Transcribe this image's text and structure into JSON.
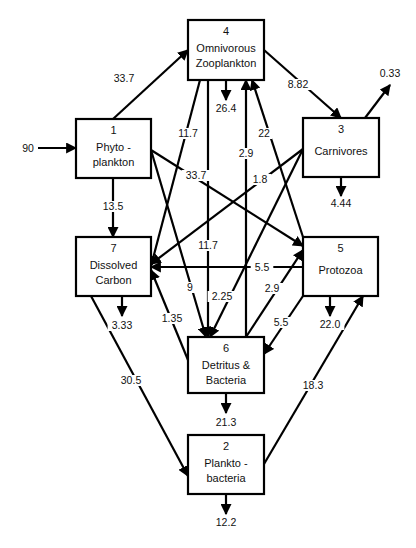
{
  "nodes": [
    {
      "id": "1",
      "number": "1",
      "line1": "Phyto  -",
      "line2": "plankton",
      "x": 76,
      "y": 119,
      "w": 75,
      "h": 59
    },
    {
      "id": "2",
      "number": "2",
      "line1": "Plankto  -",
      "line2": "bacteria",
      "x": 188,
      "y": 435,
      "w": 76,
      "h": 59
    },
    {
      "id": "3",
      "number": "3",
      "line1": "Carnivores",
      "line2": "",
      "x": 303,
      "y": 118,
      "w": 76,
      "h": 59
    },
    {
      "id": "4",
      "number": "4",
      "line1": "Omnivorous",
      "line2": "Zooplankton",
      "x": 188,
      "y": 20,
      "w": 76,
      "h": 60
    },
    {
      "id": "5",
      "number": "5",
      "line1": "Protozoa",
      "line2": "",
      "x": 303,
      "y": 237,
      "w": 75,
      "h": 59
    },
    {
      "id": "6",
      "number": "6",
      "line1": "Detritus  &",
      "line2": "Bacteria",
      "x": 188,
      "y": 337,
      "w": 76,
      "h": 56
    },
    {
      "id": "7",
      "number": "7",
      "line1": "Dissolved",
      "line2": "Carbon",
      "x": 76,
      "y": 237,
      "w": 75,
      "h": 59
    }
  ],
  "flows": [
    {
      "from": "input",
      "to": "1",
      "value": "90",
      "x1": 38,
      "y1": 148,
      "x2": 76,
      "y2": 148,
      "lx": 28,
      "ly": 152
    },
    {
      "from": "1",
      "to": "4",
      "value": "33.7",
      "x1": 113,
      "y1": 119,
      "x2": 188,
      "y2": 50,
      "lx": 124,
      "ly": 82
    },
    {
      "from": "1",
      "to": "7",
      "value": "13.5",
      "x1": 113,
      "y1": 178,
      "x2": 113,
      "y2": 237,
      "lx": 113,
      "ly": 210
    },
    {
      "from": "1",
      "to": "5",
      "value": "33.7",
      "x1": 151,
      "y1": 150,
      "x2": 303,
      "y2": 246,
      "lx": 196,
      "ly": 179
    },
    {
      "from": "1",
      "to": "6",
      "value": "9",
      "x1": 151,
      "y1": 150,
      "x2": 206,
      "y2": 337,
      "lx": 190,
      "ly": 291
    },
    {
      "from": "4",
      "to": "7",
      "value": "11.7",
      "x1": 200,
      "y1": 80,
      "x2": 151,
      "y2": 266,
      "lx": 188,
      "ly": 137
    },
    {
      "from": "4",
      "to": "6",
      "value": "11.7",
      "x1": 208,
      "y1": 80,
      "x2": 208,
      "y2": 337,
      "lx": 208,
      "ly": 249
    },
    {
      "from": "4",
      "to": "out",
      "value": "26.4",
      "x1": 226,
      "y1": 80,
      "x2": 226,
      "y2": 100,
      "lx": 226,
      "ly": 112
    },
    {
      "from": "4",
      "to": "3",
      "value": "8.82",
      "x1": 264,
      "y1": 50,
      "x2": 341,
      "y2": 118,
      "lx": 298,
      "ly": 88
    },
    {
      "from": "6",
      "to": "4",
      "value": "2.9",
      "x1": 246,
      "y1": 337,
      "x2": 246,
      "y2": 80,
      "lx": 246,
      "ly": 157
    },
    {
      "from": "5",
      "to": "4",
      "value": "22",
      "x1": 303,
      "y1": 237,
      "x2": 252,
      "y2": 80,
      "lx": 264,
      "ly": 137
    },
    {
      "from": "3",
      "to": "out",
      "value": "0.33",
      "x1": 365,
      "y1": 118,
      "x2": 390,
      "y2": 85,
      "lx": 390,
      "ly": 77
    },
    {
      "from": "3",
      "to": "7",
      "value": "1.8",
      "x1": 303,
      "y1": 149,
      "x2": 151,
      "y2": 264,
      "lx": 260,
      "ly": 183
    },
    {
      "from": "3",
      "to": "6",
      "value": "2.25",
      "x1": 303,
      "y1": 149,
      "x2": 210,
      "y2": 337,
      "lx": 222,
      "ly": 300
    },
    {
      "from": "3",
      "to": "out",
      "value": "4.44",
      "x1": 341,
      "y1": 177,
      "x2": 341,
      "y2": 196,
      "lx": 341,
      "ly": 207
    },
    {
      "from": "5",
      "to": "7",
      "value": "5.5",
      "x1": 303,
      "y1": 267,
      "x2": 151,
      "y2": 267,
      "lx": 262,
      "ly": 271
    },
    {
      "from": "6",
      "to": "5",
      "value": "2.9",
      "x1": 246,
      "y1": 337,
      "x2": 303,
      "y2": 250,
      "lx": 272,
      "ly": 292
    },
    {
      "from": "5",
      "to": "6",
      "value": "5.5",
      "x1": 303,
      "y1": 296,
      "x2": 264,
      "y2": 354,
      "lx": 281,
      "ly": 326
    },
    {
      "from": "5",
      "to": "out",
      "value": "22.0",
      "x1": 330,
      "y1": 296,
      "x2": 330,
      "y2": 316,
      "lx": 330,
      "ly": 328
    },
    {
      "from": "6",
      "to": "7",
      "value": "1.35",
      "x1": 188,
      "y1": 360,
      "x2": 151,
      "y2": 270,
      "lx": 172,
      "ly": 322
    },
    {
      "from": "7",
      "to": "out",
      "value": "3.33",
      "x1": 122,
      "y1": 296,
      "x2": 122,
      "y2": 316,
      "lx": 122,
      "ly": 329
    },
    {
      "from": "7",
      "to": "2",
      "value": "30.5",
      "x1": 91,
      "y1": 296,
      "x2": 188,
      "y2": 476,
      "lx": 131,
      "ly": 384
    },
    {
      "from": "6",
      "to": "out",
      "value": "21.3",
      "x1": 226,
      "y1": 393,
      "x2": 226,
      "y2": 413,
      "lx": 226,
      "ly": 426
    },
    {
      "from": "2",
      "to": "5",
      "value": "18.3",
      "x1": 264,
      "y1": 464,
      "x2": 363,
      "y2": 296,
      "lx": 313,
      "ly": 389
    },
    {
      "from": "2",
      "to": "out",
      "value": "12.2",
      "x1": 226,
      "y1": 494,
      "x2": 226,
      "y2": 514,
      "lx": 226,
      "ly": 526
    }
  ]
}
